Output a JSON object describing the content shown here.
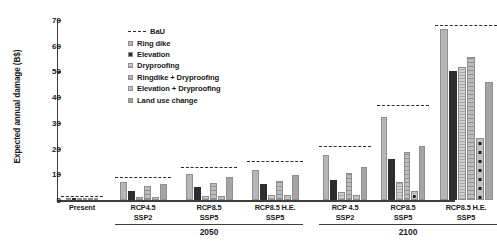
{
  "chart_data": {
    "type": "bar",
    "title": "",
    "xlabel": "",
    "ylabel": "Expected annual damage (B$)",
    "ylim": [
      0,
      70
    ],
    "yticks": [
      0,
      10,
      20,
      30,
      40,
      50,
      60,
      70
    ],
    "grid": false,
    "legend_position": "upper-left-inside",
    "categories": [
      "Present",
      "RCP4.5 SSP2",
      "RCP8.5 SSP5",
      "RCP8.5 H.E. SSP5",
      "RCP 4.5 SSP2",
      "RCP8.5 SSP5",
      "RCP8.5 H.E. SSP5"
    ],
    "category_lines": [
      [
        "Present",
        ""
      ],
      [
        "RCP4.5",
        "SSP2"
      ],
      [
        "RCP8.5",
        "SSP5"
      ],
      [
        "RCP8.5 H.E.",
        "SSP5"
      ],
      [
        "RCP 4.5",
        "SSP2"
      ],
      [
        "RCP8.5",
        "SSP5"
      ],
      [
        "RCP8.5 H.E.",
        "SSP5"
      ]
    ],
    "eras": [
      {
        "label": "2050",
        "categories": [
          "RCP4.5 SSP2",
          "RCP8.5 SSP5",
          "RCP8.5 H.E. SSP5"
        ]
      },
      {
        "label": "2100",
        "categories": [
          "RCP 4.5 SSP2",
          "RCP8.5 SSP5",
          "RCP8.5 H.E. SSP5"
        ]
      }
    ],
    "series": [
      {
        "name": "Ring dike",
        "pattern": "solid-light-gray",
        "color": "#b6b6b6",
        "values": [
          0.6,
          7.2,
          10.0,
          11.6,
          17.6,
          32.4,
          66.5
        ]
      },
      {
        "name": "Elevation",
        "pattern": "solid-black",
        "color": "#2d2d2d",
        "values": [
          0.4,
          3.4,
          5.0,
          6.2,
          7.8,
          15.8,
          50.0
        ]
      },
      {
        "name": "Dryproofing",
        "pattern": "horizontal-lines",
        "color": "#cfcfcf",
        "values": [
          0.3,
          1.2,
          1.6,
          2.0,
          3.0,
          7.0,
          51.8
        ]
      },
      {
        "name": "Ringdike + Dryproofing",
        "pattern": "fine-lines",
        "color": "#bdbdbd",
        "values": [
          0.5,
          5.6,
          6.8,
          7.4,
          10.6,
          18.6,
          55.5
        ]
      },
      {
        "name": "Elevation + Dryproofing",
        "pattern": "dotted",
        "color": "#c2c2c2",
        "values": [
          0.2,
          1.0,
          1.4,
          1.8,
          2.0,
          3.4,
          24.0
        ]
      },
      {
        "name": "Land use change",
        "pattern": "solid-mid-gray",
        "color": "#a5a5a5",
        "values": [
          0.6,
          6.4,
          8.8,
          9.6,
          13.0,
          21.0,
          45.8
        ]
      }
    ],
    "bau": {
      "name": "BaU",
      "style": "dashed",
      "color": "#2b2b2b",
      "values": [
        1.0,
        8.4,
        12.6,
        14.6,
        20.8,
        36.6,
        67.6
      ]
    }
  },
  "legend": {
    "items": [
      {
        "label": "BaU",
        "swatch": "dashed-line"
      },
      {
        "label": "Ring dike",
        "swatch": "solid-light-gray"
      },
      {
        "label": "Elevation",
        "swatch": "solid-black"
      },
      {
        "label": "Dryproofing",
        "swatch": "horizontal-lines"
      },
      {
        "label": "Ringdike + Dryproofing",
        "swatch": "fine-lines"
      },
      {
        "label": "Elevation + Dryproofing",
        "swatch": "dotted"
      },
      {
        "label": "Land use change",
        "swatch": "solid-mid-gray"
      }
    ]
  }
}
